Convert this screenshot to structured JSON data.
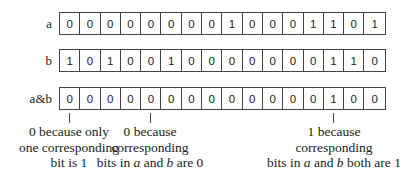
{
  "rows": [
    {
      "label": "a",
      "bits": [
        "0",
        "0",
        "0",
        "0",
        "0",
        "0",
        "0",
        "0",
        "1",
        "0",
        "0",
        "0",
        "1",
        "1",
        "0",
        "1"
      ]
    },
    {
      "label": "b",
      "bits": [
        "1",
        "0",
        "1",
        "0",
        "0",
        "1",
        "0",
        "0",
        "0",
        "0",
        "0",
        "0",
        "0",
        "1",
        "1",
        "0"
      ]
    },
    {
      "label": "a&b",
      "bits": [
        "0",
        "0",
        "0",
        "0",
        "0",
        "0",
        "0",
        "0",
        "0",
        "0",
        "0",
        "0",
        "0",
        "1",
        "0",
        "0"
      ]
    }
  ],
  "annotations": [
    {
      "bit_index": 0,
      "lines": [
        "0 because only",
        "one corresponding",
        "bit is 1"
      ]
    },
    {
      "bit_index": 4,
      "lines": [
        "0 because",
        "corresponding",
        "bits in",
        "a",
        "and",
        "b",
        "are 0"
      ]
    },
    {
      "bit_index": 13,
      "lines": [
        "1 because",
        "corresponding",
        "bits in",
        "a",
        "and",
        "b",
        "both are 1"
      ]
    }
  ],
  "notes": {
    "n0": {
      "l1": "0 because only",
      "l2": "one corresponding",
      "l3": "bit is 1"
    },
    "n1": {
      "l1": "0 because",
      "l2": "corresponding",
      "l3a": "bits in ",
      "var_a": "a",
      "l3b": " and ",
      "var_b": "b",
      "l3c": " are 0"
    },
    "n2": {
      "l1": "1 because",
      "l2": "corresponding",
      "l3a": "bits in ",
      "var_a": "a",
      "l3b": " and ",
      "var_b": "b",
      "l3c": " both are 1"
    }
  }
}
